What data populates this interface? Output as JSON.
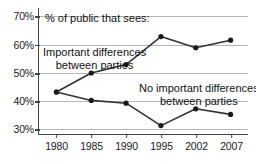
{
  "chart_data": {
    "type": "line",
    "title": "% of public that sees:",
    "xlabel": "",
    "ylabel": "",
    "categories": [
      "1980",
      "1985",
      "1990",
      "1995",
      "2002",
      "2007"
    ],
    "yticks": [
      "30%",
      "40%",
      "50%",
      "60%",
      "70%"
    ],
    "ytick_values": [
      30,
      40,
      50,
      60,
      70
    ],
    "ylim": [
      28,
      73
    ],
    "grid": "horizontal",
    "legend": "inline-annotations",
    "series": [
      {
        "name": "Important differences between parties",
        "label_line1": "Important differences",
        "label_line2": "between parties",
        "color": "#333333",
        "values": [
          43,
          49.8,
          52.8,
          62.8,
          58.8,
          61.5
        ]
      },
      {
        "name": "No important differences between parties",
        "label_line1": "No important differences",
        "label_line2": "between parties",
        "color": "#333333",
        "values": [
          43,
          40,
          39,
          31,
          37,
          35
        ]
      }
    ]
  },
  "colors": {
    "line": "#333333",
    "marker": "#1a1a1a",
    "grid": "#b5b5b5",
    "axis": "#444444",
    "text": "#111111",
    "background": "#ffffff"
  }
}
